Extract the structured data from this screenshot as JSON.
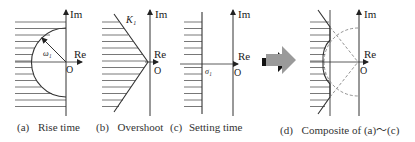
{
  "figure": {
    "panels": [
      {
        "id": "a",
        "tag": "(a)",
        "title": "Rise time",
        "axes": {
          "im": "Im",
          "re": "Re",
          "origin": "O"
        },
        "annotation": "ω₁"
      },
      {
        "id": "b",
        "tag": "(b)",
        "title": "Overshoot",
        "axes": {
          "im": "Im",
          "re": "Re",
          "origin": "O"
        },
        "annotation": "K₁"
      },
      {
        "id": "c",
        "tag": "(c)",
        "title": "Setting time",
        "axes": {
          "im": "Im",
          "re": "Re",
          "origin": "O"
        },
        "annotation": "σ₁"
      },
      {
        "id": "d",
        "tag": "(d)",
        "title": "Composite of (a)～(c)",
        "axes": {
          "im": "Im",
          "re": "Re",
          "origin": "O"
        }
      }
    ],
    "arrow": "right-arrow",
    "colors": {
      "line": "#333333",
      "hatch": "#555555",
      "dashed": "#777777",
      "arrow_fill": "#9a9a9a",
      "arrow_shadow": "#111111"
    }
  }
}
